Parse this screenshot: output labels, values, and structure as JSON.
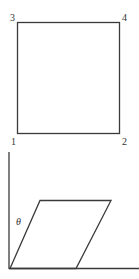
{
  "figure": {
    "top": {
      "shape": "square",
      "corners": [
        {
          "label": "1",
          "position": "bottom-left"
        },
        {
          "label": "2",
          "position": "bottom-right"
        },
        {
          "label": "3",
          "position": "top-left"
        },
        {
          "label": "4",
          "position": "top-right"
        }
      ]
    },
    "bottom": {
      "shape": "parallelogram (sheared square)",
      "angle_label": "θ",
      "axes": [
        "vertical",
        "horizontal"
      ]
    },
    "colors": {
      "stroke": "#3a3a3a",
      "background": "#ffffff",
      "text": "#333333"
    }
  }
}
